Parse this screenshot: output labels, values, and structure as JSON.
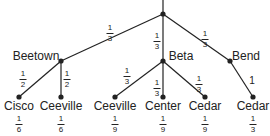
{
  "tree": {
    "root": {
      "x": 163,
      "y": 14
    },
    "branches": [
      {
        "name": "Beetown",
        "x": 61,
        "y": 61,
        "prob": {
          "num": "1",
          "den": "3"
        },
        "prob_pos": {
          "x": 110,
          "y": 24
        },
        "label_pos": {
          "x": 36,
          "y": 50
        }
      },
      {
        "name": "Beta",
        "x": 163,
        "y": 61,
        "prob": {
          "num": "1",
          "den": "3"
        },
        "prob_pos": {
          "x": 157,
          "y": 32
        },
        "label_pos": {
          "x": 181,
          "y": 50
        }
      },
      {
        "name": "Bend",
        "x": 230,
        "y": 61,
        "prob": {
          "num": "1",
          "den": "3"
        },
        "prob_pos": {
          "x": 205,
          "y": 30
        },
        "label_pos": {
          "x": 246,
          "y": 50
        }
      }
    ],
    "leaves": [
      {
        "name": "Cisco",
        "parent": 0,
        "x": 19,
        "y": 97,
        "edge_prob": {
          "num": "1",
          "den": "2"
        },
        "edge_pos": {
          "x": 23,
          "y": 70
        },
        "final": {
          "num": "1",
          "den": "6"
        }
      },
      {
        "name": "Ceeville",
        "parent": 0,
        "x": 61,
        "y": 97,
        "edge_prob": {
          "num": "1",
          "den": "2"
        },
        "edge_pos": {
          "x": 67,
          "y": 70
        },
        "final": {
          "num": "1",
          "den": "6"
        }
      },
      {
        "name": "Ceeville",
        "parent": 1,
        "x": 115,
        "y": 97,
        "edge_prob": {
          "num": "1",
          "den": "3"
        },
        "edge_pos": {
          "x": 127,
          "y": 67
        },
        "final": {
          "num": "1",
          "den": "9"
        }
      },
      {
        "name": "Center",
        "parent": 1,
        "x": 163,
        "y": 97,
        "edge_prob": {
          "num": "1",
          "den": "3"
        },
        "edge_pos": {
          "x": 157,
          "y": 79
        },
        "final": {
          "num": "1",
          "den": "9"
        }
      },
      {
        "name": "Cedar",
        "parent": 1,
        "x": 205,
        "y": 97,
        "edge_prob": {
          "num": "1",
          "den": "3"
        },
        "edge_pos": {
          "x": 199,
          "y": 75
        },
        "final": {
          "num": "1",
          "den": "9"
        }
      },
      {
        "name": "Cedar",
        "parent": 2,
        "x": 253,
        "y": 97,
        "edge_prob": {
          "whole": "1"
        },
        "edge_pos": {
          "x": 252,
          "y": 75
        },
        "final": {
          "num": "1",
          "den": "3"
        }
      }
    ],
    "colors": {
      "line": "#222222",
      "node": "#222222"
    }
  }
}
